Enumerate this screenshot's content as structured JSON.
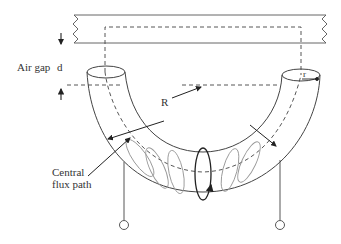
{
  "diagram": {
    "title": "",
    "labels": {
      "air_gap": "Air gap",
      "gap_symbol": "d",
      "major_radius": "R",
      "minor_radius": "r",
      "flux_path_line1": "Central",
      "flux_path_line2": "flux path"
    },
    "colors": {
      "stroke": "#333333",
      "coil": "#999999",
      "background": "#ffffff"
    }
  }
}
